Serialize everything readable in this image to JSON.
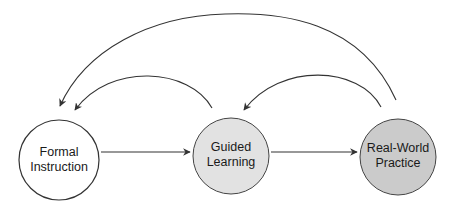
{
  "diagram": {
    "type": "cycle-flow",
    "nodes": [
      {
        "id": "formal",
        "line1": "Formal",
        "line2": "Instruction",
        "fill": "#ffffff"
      },
      {
        "id": "guided",
        "line1": "Guided",
        "line2": "Learning",
        "fill": "#e2e2e2"
      },
      {
        "id": "practice",
        "line1": "Real-World",
        "line2": "Practice",
        "fill": "#cbcbcb"
      }
    ],
    "edges": [
      {
        "from": "formal",
        "to": "guided",
        "style": "straight"
      },
      {
        "from": "guided",
        "to": "practice",
        "style": "straight"
      },
      {
        "from": "guided",
        "to": "formal",
        "style": "arc"
      },
      {
        "from": "practice",
        "to": "guided",
        "style": "arc"
      },
      {
        "from": "practice",
        "to": "formal",
        "style": "arc-large"
      }
    ],
    "colors": {
      "stroke": "#333333",
      "text": "#1a1a1a"
    }
  }
}
